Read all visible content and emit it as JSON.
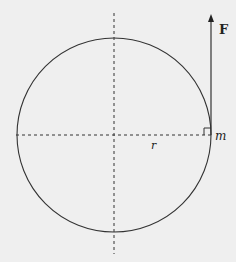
{
  "diagram": {
    "type": "circular-motion-force",
    "labels": {
      "force": "F",
      "mass": "m",
      "radius": "r"
    },
    "colors": {
      "background": "#efefef",
      "stroke": "#333333"
    },
    "geometry": {
      "center": [
        114,
        135
      ],
      "radius": 97,
      "arrow_top_y": 15
    }
  }
}
